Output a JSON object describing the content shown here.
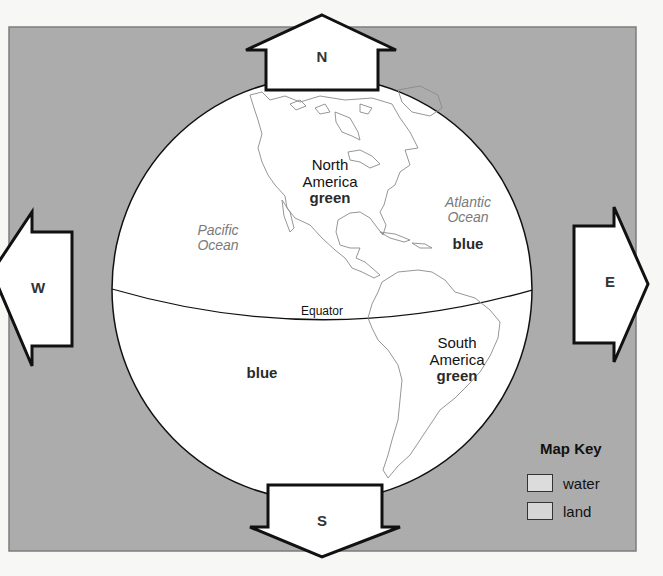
{
  "map": {
    "panel_color": "#acacac",
    "globe_color": "#ffffff",
    "directions": {
      "north": "N",
      "south": "S",
      "east": "E",
      "west": "W"
    },
    "equator_label": "Equator",
    "continents": [
      {
        "name_line1": "North",
        "name_line2": "America",
        "color_word": "green"
      },
      {
        "name_line1": "South",
        "name_line2": "America",
        "color_word": "green"
      }
    ],
    "oceans": [
      {
        "name_line1": "Pacific",
        "name_line2": "Ocean"
      },
      {
        "name_line1": "Atlantic",
        "name_line2": "Ocean"
      }
    ],
    "water_labels": [
      "blue",
      "blue"
    ]
  },
  "map_key": {
    "title": "Map Key",
    "items": [
      {
        "label": "water",
        "swatch_color": "#dcdcdc"
      },
      {
        "label": "land",
        "swatch_color": "#d6d6d6"
      }
    ]
  }
}
